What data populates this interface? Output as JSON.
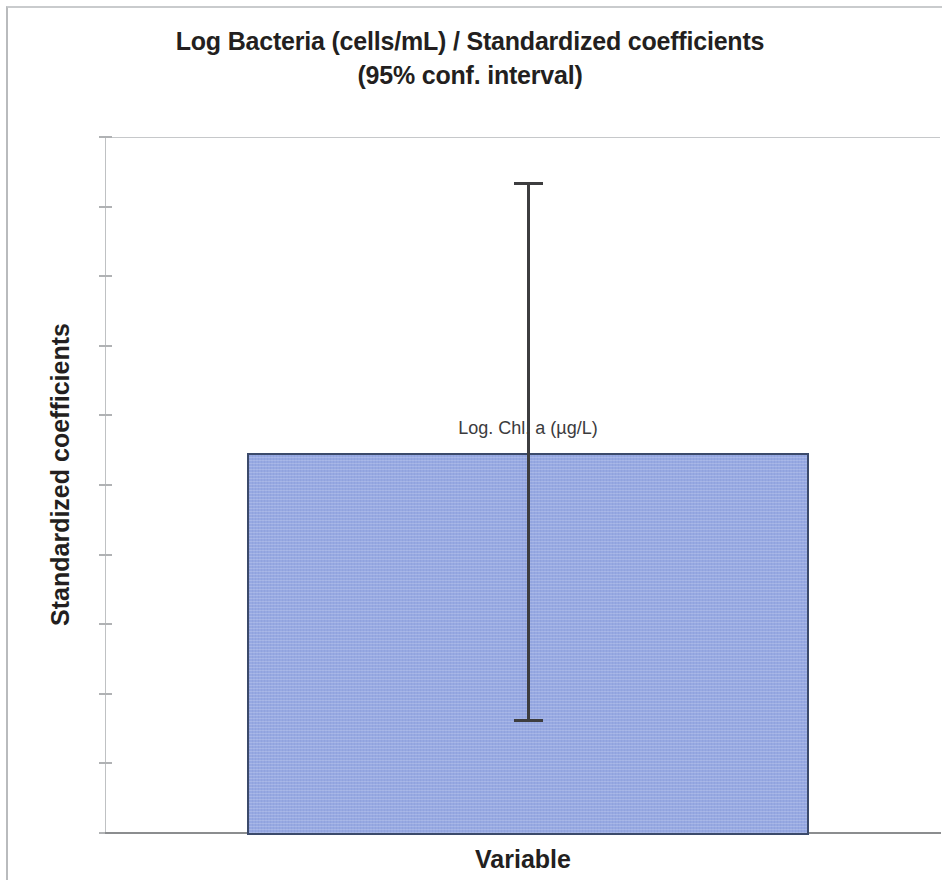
{
  "chart_data": {
    "type": "bar",
    "title": "Log Bacteria (cells/mL) / Standardized coefficients (95% conf. interval)",
    "title_line1": "Log Bacteria (cells/mL) / Standardized coefficients",
    "title_line2": "(95% conf. interval)",
    "xlabel": "Variable",
    "ylabel": "Standardized coefficients",
    "categories": [
      "Log. Chl. a (µg/L)"
    ],
    "values": [
      0.546
    ],
    "error_low": [
      0.159
    ],
    "error_high": [
      0.935
    ],
    "error_interval_label": "95% conf. interval",
    "data_labels": [
      "Log. Chl. a (µg/L)"
    ],
    "ylim": [
      0,
      1
    ],
    "ytick_labels": [
      "1",
      "0.9",
      "0.8",
      "0.7",
      "0.6",
      "0.5",
      "0.4",
      "0.3",
      "0.2",
      "0.1",
      "0"
    ],
    "ytick_values": [
      1,
      0.9,
      0.8,
      0.7,
      0.6,
      0.5,
      0.4,
      0.3,
      0.2,
      0.1,
      0
    ],
    "xtick_labels": [],
    "grid": false,
    "legend": false,
    "legend_position": "none",
    "bar_color": "#97a9e2",
    "bar_border_color": "#3b4a6b",
    "error_bar_color": "#3d3d3f",
    "axis_color": "#8b8d8f",
    "text_color": "#231f20"
  }
}
